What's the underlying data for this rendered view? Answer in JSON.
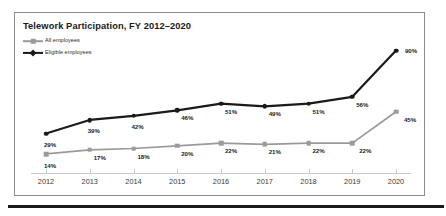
{
  "chart": {
    "title": "Telework Participation, FY 2012–2020"
  },
  "legend": [
    {
      "label": "All employees",
      "marker": "grey-square",
      "color": "#9a9a9a"
    },
    {
      "label": "Eligible employees",
      "marker": "black-diamond",
      "color": "#1a1a1a"
    }
  ],
  "chart_data": {
    "type": "line",
    "title": "Telework Participation, FY 2012–2020",
    "xlabel": "",
    "ylabel": "",
    "ylim": [
      0,
      100
    ],
    "grid": false,
    "legend_position": "top-left",
    "categories": [
      "2012",
      "2013",
      "2014",
      "2015",
      "2016",
      "2017",
      "2018",
      "2019",
      "2020"
    ],
    "series": [
      {
        "name": "Eligible employees",
        "color": "#1a1a1a",
        "marker": "circle",
        "values": [
          29,
          39,
          42,
          46,
          51,
          49,
          51,
          56,
          90
        ],
        "labels": [
          "29%",
          "39%",
          "42%",
          "46%",
          "51%",
          "49%",
          "51%",
          "56%",
          "90%"
        ]
      },
      {
        "name": "All employees",
        "color": "#9a9a9a",
        "marker": "square",
        "values": [
          14,
          17,
          18,
          20,
          22,
          21,
          22,
          22,
          45
        ],
        "labels": [
          "14%",
          "17%",
          "18%",
          "20%",
          "22%",
          "21%",
          "22%",
          "22%",
          "45%"
        ]
      }
    ]
  }
}
